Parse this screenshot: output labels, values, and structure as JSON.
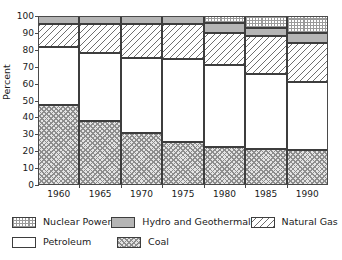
{
  "chart_data": {
    "type": "bar",
    "stacked": true,
    "title": "",
    "xlabel": "",
    "ylabel": "Percent",
    "categories": [
      "1960",
      "1965",
      "1970",
      "1975",
      "1980",
      "1985",
      "1990"
    ],
    "x": [
      1960,
      1965,
      1970,
      1975,
      1980,
      1985,
      1990
    ],
    "ylim": [
      0,
      100
    ],
    "yticks": [
      0,
      10,
      20,
      30,
      40,
      50,
      60,
      70,
      80,
      90,
      100
    ],
    "ytick_labels": [
      "0",
      "10",
      "20",
      "30",
      "40",
      "50",
      "60",
      "70",
      "80",
      "90",
      "100"
    ],
    "grid": true,
    "grid_axis": "y",
    "legend_position": "below",
    "stack_order_bottom_to_top": [
      "Coal",
      "Petroleum",
      "Natural Gas",
      "Hydro and Geothermal",
      "Nuclear Power"
    ],
    "series": [
      {
        "name": "Coal",
        "pattern": "cross-hatch",
        "color": "#e4e4e4",
        "values": [
          47.5,
          38.0,
          30.5,
          25.5,
          22.5,
          21.5,
          21.0
        ]
      },
      {
        "name": "Petroleum",
        "pattern": "solid-white",
        "color": "#ffffff",
        "values": [
          34.0,
          40.0,
          44.5,
          49.0,
          48.5,
          44.0,
          40.0
        ]
      },
      {
        "name": "Natural Gas",
        "pattern": "diagonal-hatch",
        "color": "#ffffff",
        "values": [
          13.5,
          17.0,
          20.0,
          20.5,
          19.0,
          22.5,
          23.0
        ]
      },
      {
        "name": "Hydro and Geothermal",
        "pattern": "solid-gray",
        "color": "#b5b5b5",
        "values": [
          5.0,
          5.0,
          5.0,
          5.0,
          6.0,
          5.0,
          6.0
        ]
      },
      {
        "name": "Nuclear Power",
        "pattern": "dotted-checker",
        "color": "#ffffff",
        "values": [
          0.0,
          0.0,
          0.0,
          0.0,
          4.0,
          7.0,
          10.0
        ]
      }
    ],
    "cumulative_tops": {
      "Coal": [
        47.5,
        38.0,
        30.5,
        25.5,
        22.5,
        21.5,
        21.0
      ],
      "Petroleum": [
        81.5,
        78.0,
        75.0,
        74.5,
        71.0,
        65.5,
        61.0
      ],
      "Natural Gas": [
        95.0,
        95.0,
        95.0,
        95.0,
        90.0,
        88.0,
        84.0
      ],
      "Hydro and Geothermal": [
        100.0,
        100.0,
        100.0,
        100.0,
        96.0,
        93.0,
        90.0
      ],
      "Nuclear Power": [
        100.0,
        100.0,
        100.0,
        100.0,
        100.0,
        100.0,
        100.0
      ]
    }
  },
  "legend": {
    "rows": [
      [
        {
          "label": "Nuclear Power",
          "pattern": "dotted-checker"
        },
        {
          "label": "Hydro and Geothermal",
          "pattern": "solid-gray"
        },
        {
          "label": "Natural Gas",
          "pattern": "diagonal-hatch"
        }
      ],
      [
        {
          "label": "Petroleum",
          "pattern": "solid-white"
        },
        {
          "label": "Coal",
          "pattern": "cross-hatch"
        }
      ]
    ]
  }
}
